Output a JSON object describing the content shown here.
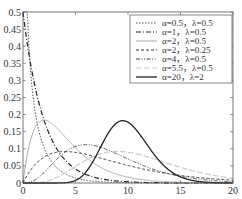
{
  "chart_data": {
    "type": "line",
    "title": "",
    "xlabel": "",
    "ylabel": "",
    "xlim": [
      0,
      20
    ],
    "ylim": [
      0,
      0.5
    ],
    "grid": false,
    "legend_position": "upper right",
    "x_ticks": [
      "0",
      "5",
      "10",
      "15",
      "20"
    ],
    "y_ticks": [
      "0",
      "0.05",
      "0.1",
      "0.15",
      "0.2",
      "0.25",
      "0.3",
      "0.35",
      "0.4",
      "0.45",
      "0.5"
    ],
    "distribution": "gamma pdf f(x)=λ^α x^(α-1) e^(-λx)/Γ(α)",
    "series": [
      {
        "name": "α=0.5，λ=0.5",
        "alpha": 0.5,
        "lambda": 0.5,
        "style": "dotted",
        "color": "#555555",
        "width": 1
      },
      {
        "name": "α=1，λ=0.5",
        "alpha": 1,
        "lambda": 0.5,
        "style": "dashdot",
        "color": "#222222",
        "width": 1.2
      },
      {
        "name": "α=2，λ=0.5",
        "alpha": 2,
        "lambda": 0.5,
        "style": "solid",
        "color": "#aaaaaa",
        "width": 1
      },
      {
        "name": "α=2，λ=0.25",
        "alpha": 2,
        "lambda": 0.25,
        "style": "dashed",
        "color": "#333333",
        "width": 1
      },
      {
        "name": "α=4，λ=0.5",
        "alpha": 4,
        "lambda": 0.5,
        "style": "dashdotdot",
        "color": "#444444",
        "width": 1
      },
      {
        "name": "α=5.5，λ=0.5",
        "alpha": 5.5,
        "lambda": 0.5,
        "style": "longdash",
        "color": "#cccccc",
        "width": 1.2
      },
      {
        "name": "α=20，λ=2",
        "alpha": 20,
        "lambda": 2,
        "style": "solid",
        "color": "#222222",
        "width": 1.3
      }
    ]
  }
}
